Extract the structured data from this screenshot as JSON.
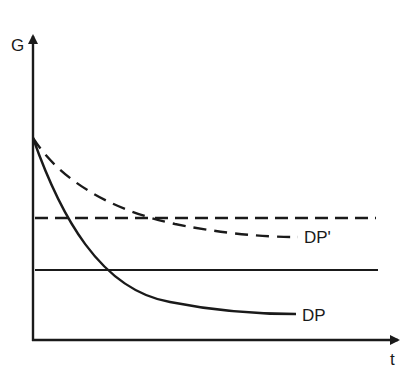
{
  "diagram": {
    "y_axis_label": "G",
    "x_axis_label": "t",
    "curves": [
      {
        "name": "DP",
        "style": "solid",
        "label": "DP"
      },
      {
        "name": "DP'",
        "style": "dashed",
        "label": "DP'"
      }
    ],
    "horizontal_lines": [
      {
        "style": "dashed",
        "level": "upper"
      },
      {
        "style": "solid",
        "level": "lower"
      }
    ],
    "colors": {
      "line": "#1a1a1a",
      "background": "#ffffff"
    }
  }
}
